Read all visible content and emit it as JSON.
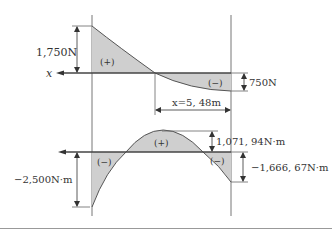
{
  "colors": {
    "fill": "#cfcfcf",
    "line": "#555555",
    "axis": "#444444",
    "text": "#333333",
    "separator": "#999999"
  },
  "shear_diagram": {
    "axis_label": "x",
    "max_label": "1,750N",
    "min_label": "750N",
    "positive_sign": "(+)",
    "negative_sign": "(−)",
    "distance_label": "x=5, 48m"
  },
  "moment_diagram": {
    "left_label": "−2,500N·m",
    "peak_label": "1,071, 94N·m",
    "right_label": "−1,666, 67N·m",
    "positive_sign": "(+)",
    "left_negative_sign": "(−)",
    "right_negative_sign": "(−)"
  }
}
